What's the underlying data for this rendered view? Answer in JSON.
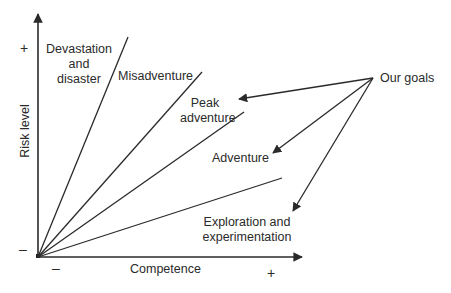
{
  "diagram": {
    "type": "risk-competence adventure zones",
    "axes": {
      "x_label": "Competence",
      "y_label": "Risk level",
      "x_min_sign": "–",
      "x_max_sign": "+",
      "y_min_sign": "–",
      "y_max_sign": "+"
    },
    "zones": [
      {
        "label_line1": "Devastation",
        "label_line2": "and",
        "label_line3": "disaster"
      },
      {
        "label": "Misadventure"
      },
      {
        "label_line1": "Peak",
        "label_line2": "adventure"
      },
      {
        "label": "Adventure"
      },
      {
        "label_line1": "Exploration and",
        "label_line2": "experimentation"
      }
    ],
    "goals": {
      "label": "Our goals",
      "points_to": [
        "Peak adventure",
        "Adventure",
        "Exploration and experimentation"
      ]
    },
    "colors": {
      "line": "#2a2a2a",
      "background": "#ffffff"
    }
  }
}
